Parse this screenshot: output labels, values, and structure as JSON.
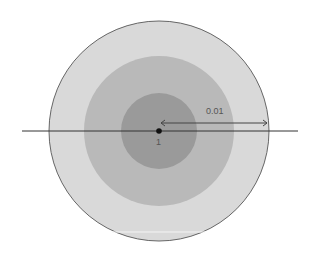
{
  "diagram": {
    "rings": [
      {
        "name": "outer",
        "radius": 110,
        "color": "#d9d9d9"
      },
      {
        "name": "middle",
        "radius": 75,
        "color": "#b9b9b9"
      },
      {
        "name": "inner",
        "radius": 38,
        "color": "#9a9a9a"
      }
    ],
    "center_label": "1",
    "distance_label": "0.01",
    "colors": {
      "stroke": "#333333",
      "outline": "#666666"
    }
  }
}
